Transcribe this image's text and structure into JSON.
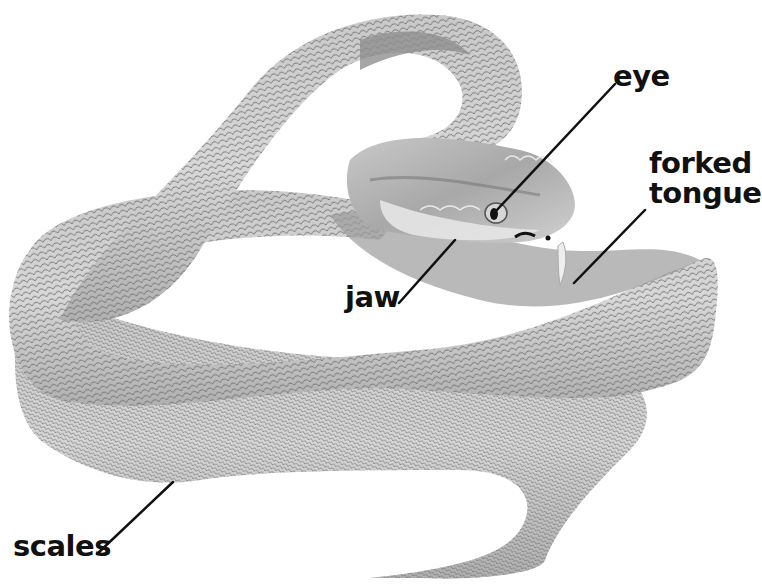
{
  "diagram": {
    "colors": {
      "background": "#ffffff",
      "body_light": "#d4d4d4",
      "body_mid": "#b8b8b8",
      "body_dark": "#8c8c8c",
      "scale_line": "#6e6e6e",
      "label_text": "#111111",
      "leader_line": "#111111"
    },
    "labels": [
      {
        "id": "eye",
        "text": "eye",
        "x": 613,
        "y": 20
      },
      {
        "id": "forked-tongue",
        "lines": [
          "forked",
          "tongue"
        ],
        "x": 649,
        "y": 146
      },
      {
        "id": "jaw",
        "text": "jaw",
        "x": 345,
        "y": 283
      },
      {
        "id": "scales",
        "text": "scales",
        "x": 13,
        "y": 532
      }
    ],
    "leaders": [
      {
        "id": "eye",
        "x1": 615,
        "y1": 84,
        "x2": 495,
        "y2": 212
      },
      {
        "id": "forked-tongue",
        "x1": 645,
        "y1": 210,
        "x2": 574,
        "y2": 283
      },
      {
        "id": "jaw",
        "x1": 399,
        "y1": 303,
        "x2": 455,
        "y2": 240
      },
      {
        "id": "scales",
        "x1": 97,
        "y1": 554,
        "x2": 173,
        "y2": 482
      }
    ]
  }
}
